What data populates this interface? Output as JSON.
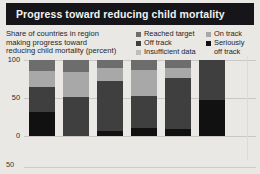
{
  "header": {
    "title": "Progress toward reducing child mortality"
  },
  "caption": {
    "line1": "Share of countries in region",
    "line2": "making progress toward",
    "line3": "reducing child mortality (percent)"
  },
  "legend": {
    "column_left": [
      {
        "label": "Reached target",
        "color": "#6d6d6d",
        "key": "reached_target"
      },
      {
        "label": "Off track",
        "color": "#3f3f3f",
        "key": "off_track"
      },
      {
        "label": "Insufficient data",
        "color": "#bdbdbd",
        "key": "insufficient_data"
      }
    ],
    "column_right": [
      {
        "label": "On track",
        "color": "#a8a8a8",
        "key": "on_track"
      },
      {
        "label": "Seriously",
        "label2": "off track",
        "color": "#111111",
        "key": "seriously_off_track"
      }
    ]
  },
  "axis": {
    "y_ticks": [
      "100",
      "50",
      "0"
    ],
    "stray_tick": "50"
  },
  "chart_data": {
    "type": "bar",
    "stacked": true,
    "title": "Progress toward reducing child mortality",
    "xlabel": "",
    "ylabel": "Share of countries in region making progress toward reducing child mortality (percent)",
    "ylim": [
      0,
      100
    ],
    "yticks": [
      0,
      50,
      100
    ],
    "grid": true,
    "legend_position": "top-right",
    "categories": [
      "1",
      "2",
      "3",
      "4",
      "5",
      "6"
    ],
    "series": [
      {
        "name": "Seriously off track",
        "color": "#111111",
        "values": [
          31,
          0,
          6,
          11,
          9,
          47
        ]
      },
      {
        "name": "Off track",
        "color": "#3f3f3f",
        "values": [
          34,
          51,
          67,
          42,
          67,
          53
        ]
      },
      {
        "name": "Insufficient data",
        "color": "#bdbdbd",
        "values": [
          0,
          0,
          0,
          0,
          0,
          0
        ]
      },
      {
        "name": "On track",
        "color": "#a8a8a8",
        "values": [
          21,
          33,
          16,
          34,
          13,
          0
        ]
      },
      {
        "name": "Reached target",
        "color": "#6d6d6d",
        "values": [
          14,
          16,
          11,
          13,
          11,
          0
        ]
      }
    ]
  }
}
